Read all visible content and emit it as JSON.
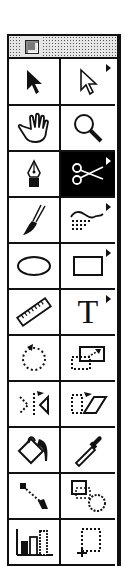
{
  "window": {
    "title": "",
    "close_box": "close-box"
  },
  "tools": [
    {
      "name": "selection-tool",
      "icon": "arrow-solid-icon",
      "flyout": false,
      "selected": false
    },
    {
      "name": "direct-selection-tool",
      "icon": "arrow-hollow-icon",
      "flyout": true,
      "selected": false
    },
    {
      "name": "hand-tool",
      "icon": "hand-icon",
      "flyout": false,
      "selected": false
    },
    {
      "name": "zoom-tool",
      "icon": "magnifier-icon",
      "flyout": false,
      "selected": false
    },
    {
      "name": "pen-tool",
      "icon": "pen-nib-icon",
      "flyout": false,
      "selected": false
    },
    {
      "name": "scissors-tool",
      "icon": "scissors-icon",
      "flyout": true,
      "selected": true
    },
    {
      "name": "brush-tool",
      "icon": "paintbrush-icon",
      "flyout": false,
      "selected": false
    },
    {
      "name": "freehand-tool",
      "icon": "freehand-icon",
      "flyout": true,
      "selected": false
    },
    {
      "name": "ellipse-tool",
      "icon": "ellipse-icon",
      "flyout": false,
      "selected": false
    },
    {
      "name": "rectangle-tool",
      "icon": "rectangle-icon",
      "flyout": true,
      "selected": false
    },
    {
      "name": "measure-tool",
      "icon": "ruler-icon",
      "flyout": false,
      "selected": false
    },
    {
      "name": "type-tool",
      "icon": "type-t-icon",
      "flyout": true,
      "selected": false,
      "glyph": "T"
    },
    {
      "name": "rotate-tool",
      "icon": "rotate-icon",
      "flyout": false,
      "selected": false
    },
    {
      "name": "scale-tool",
      "icon": "scale-icon",
      "flyout": false,
      "selected": false
    },
    {
      "name": "reflect-tool",
      "icon": "reflect-icon",
      "flyout": false,
      "selected": false
    },
    {
      "name": "shear-tool",
      "icon": "shear-icon",
      "flyout": false,
      "selected": false
    },
    {
      "name": "paint-bucket-tool",
      "icon": "paint-bucket-icon",
      "flyout": false,
      "selected": false
    },
    {
      "name": "eyedropper-tool",
      "icon": "eyedropper-icon",
      "flyout": false,
      "selected": false
    },
    {
      "name": "blend-tool",
      "icon": "blend-icon",
      "flyout": false,
      "selected": false
    },
    {
      "name": "auto-trace-tool",
      "icon": "auto-trace-icon",
      "flyout": false,
      "selected": false
    },
    {
      "name": "graph-tool",
      "icon": "bar-graph-icon",
      "flyout": false,
      "selected": false
    },
    {
      "name": "page-tool",
      "icon": "page-crop-icon",
      "flyout": false,
      "selected": false
    }
  ],
  "colors": {
    "border": "#111111",
    "selected_bg": "#000000",
    "titlebar_bg": "#e6e6e6"
  }
}
